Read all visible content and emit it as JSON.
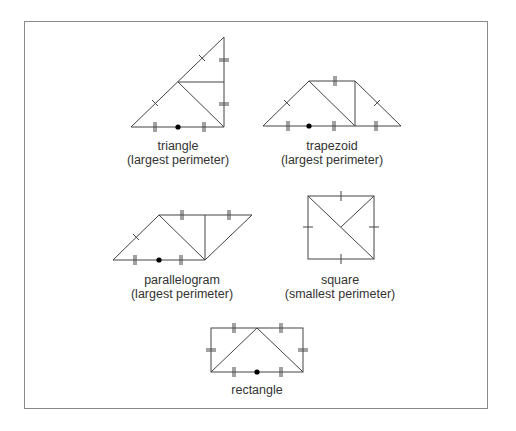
{
  "figure": {
    "shapes": [
      {
        "id": "triangle",
        "name": "triangle",
        "note": "(largest perimeter)",
        "cx": 178,
        "top": 139
      },
      {
        "id": "trapezoid",
        "name": "trapezoid",
        "note": "(largest perimeter)",
        "cx": 332,
        "top": 139
      },
      {
        "id": "parallelogram",
        "name": "parallelogram",
        "note": "(largest perimeter)",
        "cx": 182,
        "top": 273
      },
      {
        "id": "square",
        "name": "square",
        "note": "(smallest perimeter)",
        "cx": 340,
        "top": 273
      },
      {
        "id": "rectangle",
        "name": "rectangle",
        "note": "",
        "cx": 257,
        "top": 383
      }
    ],
    "colors": {
      "stroke": "#444444",
      "text": "#333333",
      "frame": "#8a8a8a",
      "dot": "#000000"
    }
  }
}
